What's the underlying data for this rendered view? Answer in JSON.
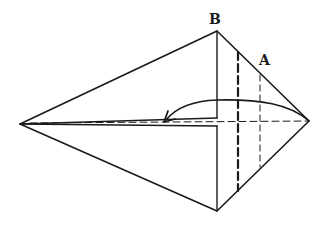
{
  "diagram": {
    "type": "origami-fold-diagram",
    "labels": {
      "top_vertex": "B",
      "right_edge_point": "A"
    },
    "colors": {
      "line": "#1a1a1a",
      "background": "#ffffff"
    },
    "annotations": [
      "Thick dashed vertical fold line",
      "Thin dashed vertical fold line near point A",
      "Curved arrow folding right point to the left along the center",
      "Horizontal dashed center crease"
    ]
  }
}
